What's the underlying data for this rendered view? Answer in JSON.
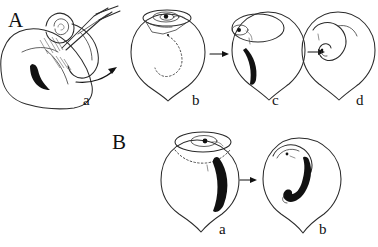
{
  "figure": {
    "type": "scientific-line-drawing",
    "background_color": "#ffffff",
    "ink_color": "#2a2a2a",
    "width": 378,
    "height": 247,
    "rows": [
      {
        "panel_letter": "A",
        "letter_position": {
          "x": 8,
          "y": 26
        },
        "description": "Surgical manipulation of an organ with forceps, followed by three stages of a pear-shaped vesicle",
        "stages": [
          {
            "label": "a",
            "label_position": {
              "x": 86,
              "y": 104
            },
            "content": "organ held with forceps, dark crescent structure inside, hatched shading",
            "has_instrument": true,
            "has_dark_crescent": true
          },
          {
            "label": "b",
            "label_position": {
              "x": 196,
              "y": 104
            },
            "content": "pear-shaped vesicle with spiral opening at top, dotted internal arc",
            "has_instrument": false,
            "has_dark_crescent": false,
            "internal_marking": "dotted-arc"
          },
          {
            "label": "c",
            "label_position": {
              "x": 276,
              "y": 104
            },
            "content": "pear-shaped vesicle with spiral at top-left and thick dark crescent inside",
            "has_instrument": false,
            "has_dark_crescent": true,
            "internal_marking": "solid-crescent"
          },
          {
            "label": "d",
            "label_position": {
              "x": 360,
              "y": 104
            },
            "content": "pear-shaped vesicle with thin outlined S-shaped coiled structure",
            "has_instrument": false,
            "has_dark_crescent": false,
            "internal_marking": "outlined-coil"
          }
        ],
        "arrows": [
          {
            "from": "a",
            "to": "b",
            "style": "curved"
          },
          {
            "from": "b",
            "to": "c",
            "style": "straight"
          },
          {
            "from": "c",
            "to": "d",
            "style": "straight"
          }
        ]
      },
      {
        "panel_letter": "B",
        "letter_position": {
          "x": 112,
          "y": 148
        },
        "description": "Two stages of a larger pear-shaped vesicle",
        "stages": [
          {
            "label": "a",
            "label_position": {
              "x": 222,
              "y": 233
            },
            "content": "vesicle with spiral opening at top, dotted rim line, thick dark crescent on right",
            "has_dark_crescent": true,
            "internal_marking": "solid-crescent"
          },
          {
            "label": "b",
            "label_position": {
              "x": 322,
              "y": 233
            },
            "content": "vesicle with thick dark J-shaped coiled structure in center",
            "has_dark_crescent": true,
            "internal_marking": "solid-j-coil"
          }
        ],
        "arrows": [
          {
            "from": "a",
            "to": "b",
            "style": "straight"
          }
        ]
      }
    ]
  }
}
